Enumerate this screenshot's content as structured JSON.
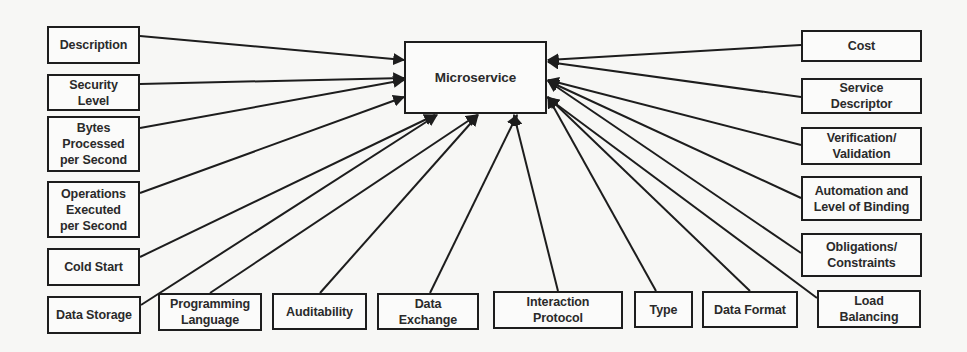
{
  "diagram": {
    "center": {
      "id": "microservice",
      "label": "Microservice",
      "x": 404,
      "y": 41,
      "w": 143,
      "h": 73
    },
    "nodes": [
      {
        "id": "description",
        "label": "Description",
        "x": 47,
        "y": 26,
        "w": 93,
        "h": 38,
        "anchor": [
          140,
          36
        ],
        "target": [
          404,
          60
        ]
      },
      {
        "id": "security-level",
        "label": "Security\nLevel",
        "x": 47,
        "y": 74,
        "w": 93,
        "h": 37,
        "anchor": [
          140,
          84
        ],
        "target": [
          404,
          78
        ]
      },
      {
        "id": "bytes-processed",
        "label": "Bytes\nProcessed\nper Second",
        "x": 47,
        "y": 116,
        "w": 93,
        "h": 56,
        "anchor": [
          140,
          128
        ],
        "target": [
          404,
          80
        ]
      },
      {
        "id": "operations-executed",
        "label": "Operations\nExecuted\nper Second",
        "x": 47,
        "y": 181,
        "w": 93,
        "h": 57,
        "anchor": [
          140,
          193
        ],
        "target": [
          404,
          97
        ]
      },
      {
        "id": "cold-start",
        "label": "Cold Start",
        "x": 47,
        "y": 248,
        "w": 93,
        "h": 38,
        "anchor": [
          140,
          257
        ],
        "target": [
          435,
          115
        ]
      },
      {
        "id": "data-storage",
        "label": "Data Storage",
        "x": 47,
        "y": 296,
        "w": 94,
        "h": 38,
        "anchor": [
          141,
          305
        ],
        "target": [
          437,
          115
        ]
      },
      {
        "id": "programming-language",
        "label": "Programming\nLanguage",
        "x": 158,
        "y": 293,
        "w": 104,
        "h": 38,
        "anchor": [
          210,
          293
        ],
        "target": [
          477,
          115
        ]
      },
      {
        "id": "auditability",
        "label": "Auditability",
        "x": 272,
        "y": 293,
        "w": 95,
        "h": 37,
        "anchor": [
          320,
          293
        ],
        "target": [
          478,
          115
        ]
      },
      {
        "id": "data-exchange",
        "label": "Data\nExchange",
        "x": 377,
        "y": 293,
        "w": 102,
        "h": 37,
        "anchor": [
          430,
          293
        ],
        "target": [
          517,
          115
        ]
      },
      {
        "id": "interaction-protocol",
        "label": "Interaction\nProtocol",
        "x": 493,
        "y": 291,
        "w": 130,
        "h": 38,
        "anchor": [
          558,
          291
        ],
        "target": [
          514,
          115
        ]
      },
      {
        "id": "type",
        "label": "Type",
        "x": 634,
        "y": 291,
        "w": 59,
        "h": 37,
        "anchor": [
          656,
          291
        ],
        "target": [
          548,
          97
        ]
      },
      {
        "id": "data-format",
        "label": "Data Format",
        "x": 702,
        "y": 291,
        "w": 96,
        "h": 37,
        "anchor": [
          750,
          291
        ],
        "target": [
          548,
          97
        ]
      },
      {
        "id": "load-balancing",
        "label": "Load\nBalancing",
        "x": 817,
        "y": 290,
        "w": 104,
        "h": 38,
        "anchor": [
          817,
          298
        ],
        "target": [
          548,
          98
        ]
      },
      {
        "id": "obligations-constraints",
        "label": "Obligations/\nConstraints",
        "x": 801,
        "y": 233,
        "w": 121,
        "h": 44,
        "anchor": [
          801,
          253
        ],
        "target": [
          548,
          81
        ]
      },
      {
        "id": "automation-binding",
        "label": "Automation and\nLevel of Binding",
        "x": 801,
        "y": 176,
        "w": 121,
        "h": 45,
        "anchor": [
          801,
          198
        ],
        "target": [
          548,
          81
        ]
      },
      {
        "id": "verification-validation",
        "label": "Verification/\nValidation",
        "x": 801,
        "y": 127,
        "w": 121,
        "h": 38,
        "anchor": [
          801,
          145
        ],
        "target": [
          548,
          80
        ]
      },
      {
        "id": "service-descriptor",
        "label": "Service\nDescriptor",
        "x": 801,
        "y": 78,
        "w": 121,
        "h": 36,
        "anchor": [
          801,
          97
        ],
        "target": [
          548,
          62
        ]
      },
      {
        "id": "cost",
        "label": "Cost",
        "x": 801,
        "y": 30,
        "w": 121,
        "h": 32,
        "anchor": [
          801,
          45
        ],
        "target": [
          548,
          60
        ]
      }
    ],
    "colors": {
      "line": "#1d1d1d",
      "box_fill": "#fbfbfa",
      "text": "#2a2a2a",
      "background": "#f7f7f5"
    }
  }
}
